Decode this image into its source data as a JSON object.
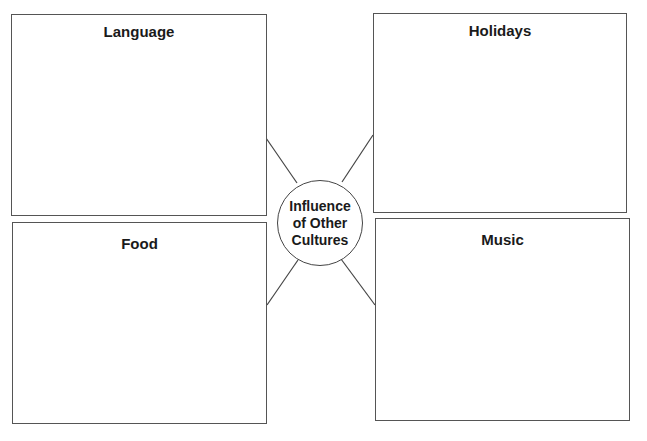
{
  "diagram": {
    "center": {
      "label_lines": [
        "Influence",
        "of Other",
        "Cultures"
      ]
    },
    "boxes": [
      {
        "id": "language",
        "title": "Language",
        "position": "top-left"
      },
      {
        "id": "holidays",
        "title": "Holidays",
        "position": "top-right"
      },
      {
        "id": "food",
        "title": "Food",
        "position": "bottom-left"
      },
      {
        "id": "music",
        "title": "Music",
        "position": "bottom-right"
      }
    ]
  }
}
